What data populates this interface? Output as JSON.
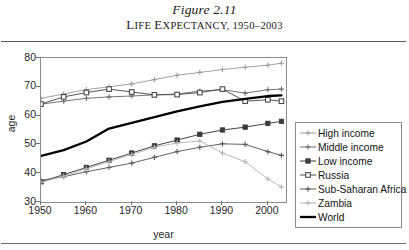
{
  "title": {
    "figure_number": "Figure 2.11",
    "caption_first": "L",
    "caption_rest_1": "IFE ",
    "caption_cap2": "E",
    "caption_rest_2": "XPECTANCY, 1950–2003",
    "caption_full": "LIFE EXPECTANCY, 1950–2003"
  },
  "axes": {
    "x_title": "year",
    "y_title": "age",
    "y_ticks": [
      "30",
      "40",
      "50",
      "60",
      "70",
      "80"
    ],
    "x_ticks": [
      "1950",
      "1960",
      "1970",
      "1980",
      "1990",
      "2000"
    ]
  },
  "legend": {
    "items": [
      {
        "label": "High income",
        "marker": "plus-marker",
        "color": "#9d9d9d"
      },
      {
        "label": "Middle income",
        "marker": "plus-marker",
        "color": "#6e6e6e"
      },
      {
        "label": "Low income",
        "marker": "square-filled-marker",
        "color": "#3b3b3b"
      },
      {
        "label": "Russia",
        "marker": "square-open-marker",
        "color": "#4a4a4a"
      },
      {
        "label": "Sub-Saharan Africa",
        "marker": "plus-marker",
        "color": "#5a5a5a"
      },
      {
        "label": "Zambia",
        "marker": "plus-marker",
        "color": "#b4b4b4"
      },
      {
        "label": "World",
        "marker": "none",
        "color": "#000000"
      }
    ]
  },
  "chart_data": {
    "type": "line",
    "title": "Life Expectancy, 1950–2003",
    "xlabel": "year",
    "ylabel": "age",
    "xlim": [
      1950,
      2004
    ],
    "ylim": [
      30,
      80
    ],
    "y_ticks": [
      30,
      40,
      50,
      60,
      70,
      80
    ],
    "x_ticks": [
      1950,
      1960,
      1970,
      1980,
      1990,
      2000
    ],
    "grid": false,
    "legend_position": "right-outside",
    "series": [
      {
        "name": "High income",
        "color": "#9d9d9d",
        "marker": "plus",
        "x": [
          1950,
          1955,
          1960,
          1965,
          1970,
          1975,
          1980,
          1985,
          1990,
          1995,
          2000,
          2003
        ],
        "values": [
          66.0,
          67.5,
          69.0,
          70.0,
          71.0,
          72.5,
          74.0,
          75.0,
          76.0,
          76.8,
          77.5,
          78.2
        ]
      },
      {
        "name": "Middle income",
        "color": "#6e6e6e",
        "marker": "plus",
        "x": [
          1950,
          1955,
          1960,
          1965,
          1970,
          1975,
          1980,
          1985,
          1990,
          1995,
          2000,
          2003
        ],
        "values": [
          64.0,
          65.0,
          66.0,
          66.5,
          66.8,
          67.2,
          67.5,
          68.5,
          69.0,
          67.8,
          69.0,
          69.2
        ]
      },
      {
        "name": "Low income",
        "color": "#3b3b3b",
        "marker": "square-filled",
        "x": [
          1950,
          1955,
          1960,
          1965,
          1970,
          1975,
          1980,
          1985,
          1990,
          1995,
          2000,
          2003
        ],
        "values": [
          37.0,
          39.5,
          42.0,
          44.5,
          47.0,
          49.5,
          51.5,
          53.5,
          55.0,
          56.0,
          57.3,
          58.0
        ]
      },
      {
        "name": "Russia",
        "color": "#4a4a4a",
        "marker": "square-open",
        "x": [
          1950,
          1955,
          1960,
          1965,
          1970,
          1975,
          1980,
          1985,
          1990,
          1995,
          2000,
          2003
        ],
        "values": [
          64.0,
          66.5,
          68.0,
          69.2,
          68.2,
          67.2,
          67.3,
          68.0,
          69.2,
          65.0,
          65.5,
          65.0
        ]
      },
      {
        "name": "Sub-Saharan Africa",
        "color": "#5a5a5a",
        "marker": "plus",
        "x": [
          1950,
          1955,
          1960,
          1965,
          1970,
          1975,
          1980,
          1985,
          1990,
          1995,
          2000,
          2003
        ],
        "values": [
          37.5,
          38.8,
          40.5,
          42.0,
          43.5,
          45.5,
          47.5,
          49.0,
          50.2,
          50.0,
          47.5,
          46.2
        ]
      },
      {
        "name": "Zambia",
        "color": "#b4b4b4",
        "marker": "plus",
        "x": [
          1950,
          1955,
          1960,
          1965,
          1970,
          1975,
          1980,
          1985,
          1990,
          1995,
          2000,
          2003
        ],
        "values": [
          36.8,
          39.0,
          41.5,
          44.0,
          46.5,
          49.0,
          50.5,
          51.2,
          47.0,
          44.0,
          38.0,
          35.2
        ]
      },
      {
        "name": "World",
        "color": "#000000",
        "marker": "none",
        "x": [
          1950,
          1955,
          1960,
          1965,
          1970,
          1975,
          1980,
          1985,
          1990,
          1995,
          2000,
          2003
        ],
        "values": [
          46.0,
          48.0,
          51.0,
          55.5,
          57.5,
          59.5,
          61.5,
          63.2,
          64.8,
          65.8,
          66.8,
          67.0
        ]
      }
    ]
  }
}
